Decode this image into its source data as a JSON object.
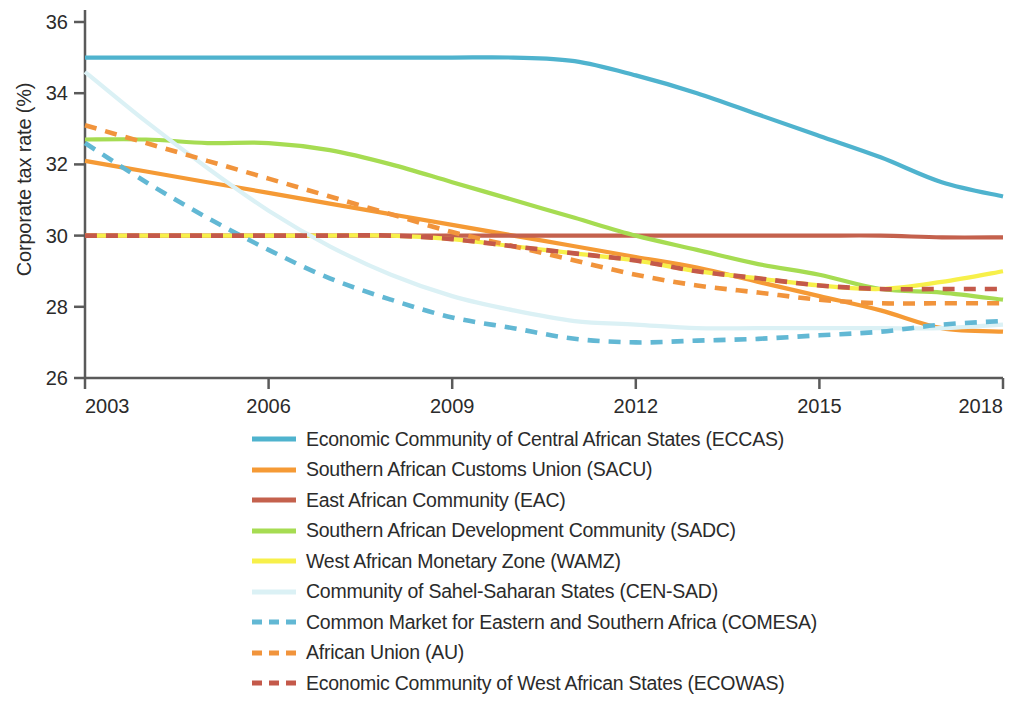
{
  "chart_data": {
    "type": "line",
    "title": "",
    "xlabel": "",
    "ylabel": "Corporate tax rate (%)",
    "xlim": [
      2003,
      2018
    ],
    "ylim": [
      26,
      36
    ],
    "xticks": [
      2003,
      2006,
      2009,
      2012,
      2015,
      2018
    ],
    "yticks": [
      26,
      28,
      30,
      32,
      34,
      36
    ],
    "grid": false,
    "legend_position": "below",
    "x": [
      2003,
      2004,
      2005,
      2006,
      2007,
      2008,
      2009,
      2010,
      2011,
      2012,
      2013,
      2014,
      2015,
      2016,
      2017,
      2018
    ],
    "series": [
      {
        "name": "Economic Community of Central African States (ECCAS)",
        "short": "ECCAS",
        "color": "#4FB3CE",
        "style": "solid",
        "values": [
          35.0,
          35.0,
          35.0,
          35.0,
          35.0,
          35.0,
          35.0,
          35.0,
          34.9,
          34.5,
          34.0,
          33.4,
          32.8,
          32.2,
          31.5,
          31.1
        ]
      },
      {
        "name": "Southern African Customs Union (SACU)",
        "short": "SACU",
        "color": "#F59A35",
        "style": "solid",
        "values": [
          32.1,
          31.8,
          31.5,
          31.2,
          30.9,
          30.6,
          30.3,
          30.0,
          29.7,
          29.4,
          29.1,
          28.7,
          28.3,
          27.9,
          27.4,
          27.3
        ]
      },
      {
        "name": "East African Community (EAC)",
        "short": "EAC",
        "color": "#C4614D",
        "style": "solid",
        "values": [
          30.0,
          30.0,
          30.0,
          30.0,
          30.0,
          30.0,
          30.0,
          30.0,
          30.0,
          30.0,
          30.0,
          30.0,
          30.0,
          30.0,
          29.95,
          29.95
        ]
      },
      {
        "name": "Southern African Development Community (SADC)",
        "short": "SADC",
        "color": "#A6DC52",
        "style": "solid",
        "values": [
          32.7,
          32.7,
          32.6,
          32.6,
          32.4,
          32.0,
          31.5,
          31.0,
          30.5,
          30.0,
          29.6,
          29.2,
          28.9,
          28.5,
          28.4,
          28.2
        ]
      },
      {
        "name": "West African Monetary Zone (WAMZ)",
        "short": "WAMZ",
        "color": "#F7F04A",
        "style": "solid",
        "values": [
          30.0,
          30.0,
          30.0,
          30.0,
          30.0,
          30.0,
          29.9,
          29.7,
          29.5,
          29.3,
          29.0,
          28.8,
          28.6,
          28.5,
          28.7,
          29.0
        ]
      },
      {
        "name": "Community of Sahel-Saharan States (CEN-SAD)",
        "short": "CEN-SAD",
        "color": "#DBF1F5",
        "style": "solid",
        "values": [
          34.6,
          33.2,
          31.9,
          30.7,
          29.7,
          28.9,
          28.3,
          27.9,
          27.6,
          27.5,
          27.4,
          27.4,
          27.4,
          27.4,
          27.4,
          27.5
        ]
      },
      {
        "name": "Common Market for Eastern and Southern Africa (COMESA)",
        "short": "COMESA",
        "color": "#62B8D4",
        "style": "dashed",
        "values": [
          32.6,
          31.5,
          30.5,
          29.6,
          28.8,
          28.2,
          27.7,
          27.4,
          27.1,
          27.0,
          27.05,
          27.1,
          27.2,
          27.3,
          27.5,
          27.6
        ]
      },
      {
        "name": "African Union (AU)",
        "short": "AU",
        "color": "#F1943C",
        "style": "dashed",
        "values": [
          33.1,
          32.6,
          32.1,
          31.6,
          31.1,
          30.6,
          30.1,
          29.7,
          29.3,
          28.9,
          28.6,
          28.4,
          28.2,
          28.1,
          28.1,
          28.1
        ]
      },
      {
        "name": "Economic Community of West African States (ECOWAS)",
        "short": "ECOWAS",
        "color": "#C4594A",
        "style": "dashed",
        "values": [
          30.0,
          30.0,
          30.0,
          30.0,
          30.0,
          30.0,
          29.9,
          29.7,
          29.5,
          29.3,
          29.0,
          28.8,
          28.6,
          28.5,
          28.5,
          28.5
        ]
      }
    ]
  },
  "axis": {
    "ylabel": "Corporate tax rate (%)",
    "ytick_labels": [
      "36",
      "34",
      "32",
      "30",
      "28",
      "26"
    ],
    "xtick_labels": [
      "2003",
      "2006",
      "2009",
      "2012",
      "2015",
      "2018"
    ],
    "axis_color": "#5a5a5a"
  },
  "legend": {
    "items": [
      {
        "label": "Economic Community of Central African States (ECCAS)",
        "color": "#4FB3CE",
        "style": "solid"
      },
      {
        "label": "Southern African Customs Union (SACU)",
        "color": "#F59A35",
        "style": "solid"
      },
      {
        "label": "East African Community (EAC)",
        "color": "#C4614D",
        "style": "solid"
      },
      {
        "label": "Southern African Development Community (SADC)",
        "color": "#A6DC52",
        "style": "solid"
      },
      {
        "label": "West African Monetary Zone (WAMZ)",
        "color": "#F7F04A",
        "style": "solid"
      },
      {
        "label": "Community of Sahel-Saharan States (CEN-SAD)",
        "color": "#DBF1F5",
        "style": "solid"
      },
      {
        "label": "Common Market for Eastern and Southern Africa (COMESA)",
        "color": "#62B8D4",
        "style": "dashed"
      },
      {
        "label": "African Union (AU)",
        "color": "#F1943C",
        "style": "dashed"
      },
      {
        "label": "Economic Community of West African States (ECOWAS)",
        "color": "#C4594A",
        "style": "dashed"
      }
    ]
  }
}
